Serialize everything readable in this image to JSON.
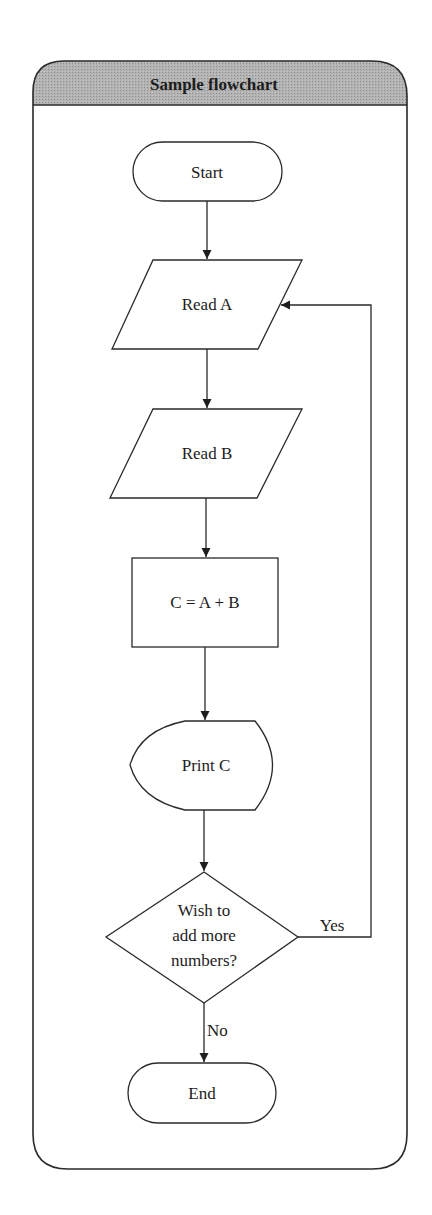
{
  "diagram": {
    "title": "Sample flowchart",
    "colors": {
      "header_fill": "#a9a9a9",
      "stroke": "#2a2a2a",
      "background": "#ffffff"
    },
    "nodes": [
      {
        "id": "start",
        "type": "terminal",
        "label": "Start"
      },
      {
        "id": "read_a",
        "type": "input-output",
        "label": "Read A"
      },
      {
        "id": "read_b",
        "type": "input-output",
        "label": "Read B"
      },
      {
        "id": "compute",
        "type": "process",
        "label": "C = A + B"
      },
      {
        "id": "print_c",
        "type": "display",
        "label": "Print C"
      },
      {
        "id": "decision",
        "type": "decision",
        "label_lines": [
          "Wish to",
          "add more",
          "numbers?"
        ]
      },
      {
        "id": "end",
        "type": "terminal",
        "label": "End"
      }
    ],
    "edges": [
      {
        "from": "start",
        "to": "read_a",
        "label": ""
      },
      {
        "from": "read_a",
        "to": "read_b",
        "label": ""
      },
      {
        "from": "read_b",
        "to": "compute",
        "label": ""
      },
      {
        "from": "compute",
        "to": "print_c",
        "label": ""
      },
      {
        "from": "print_c",
        "to": "decision",
        "label": ""
      },
      {
        "from": "decision",
        "to": "read_a",
        "label": "Yes"
      },
      {
        "from": "decision",
        "to": "end",
        "label": "No"
      }
    ]
  }
}
